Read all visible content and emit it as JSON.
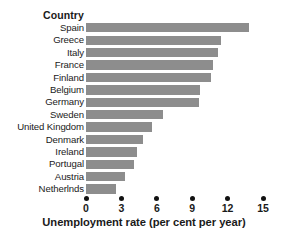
{
  "header": {
    "column_label": "Country"
  },
  "axis": {
    "title": "Unemployment rate (per cent per year)",
    "ticks": [
      "0",
      "3",
      "6",
      "9",
      "12",
      "15"
    ]
  },
  "style": {
    "bar_color": "#8d8d8d",
    "text_color": "#1a1a1a",
    "tick_color": "#111111",
    "background": "#ffffff"
  },
  "chart_data": {
    "type": "bar",
    "orientation": "horizontal",
    "title": "",
    "xlabel": "Unemployment rate (per cent per year)",
    "ylabel": "Country",
    "xlim": [
      0,
      15
    ],
    "xticks": [
      0,
      3,
      6,
      9,
      12,
      15
    ],
    "grid": false,
    "legend": false,
    "categories": [
      "Spain",
      "Greece",
      "Italy",
      "France",
      "Finland",
      "Belgium",
      "Germany",
      "Sweden",
      "United Kingdom",
      "Denmark",
      "Ireland",
      "Portugal",
      "Austria",
      "Netherlnds"
    ],
    "values": [
      13.8,
      11.4,
      11.2,
      10.8,
      10.6,
      9.7,
      9.6,
      6.5,
      5.6,
      4.8,
      4.3,
      4.1,
      3.3,
      2.5
    ]
  }
}
